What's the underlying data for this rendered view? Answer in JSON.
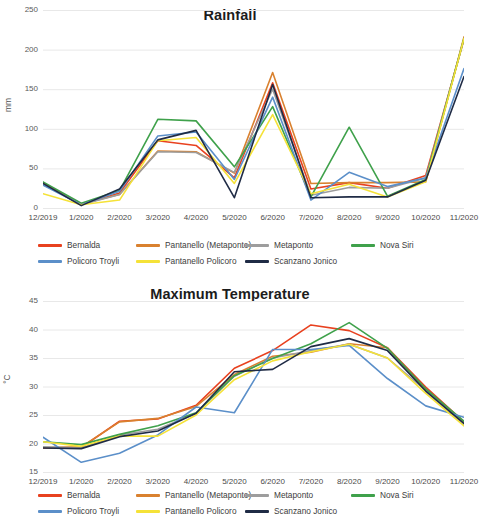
{
  "chart_data": [
    {
      "type": "line",
      "title": "Rainfall",
      "xlabel": "",
      "ylabel": "mm",
      "ylim": [
        0,
        250
      ],
      "yticks": [
        0,
        50,
        100,
        150,
        200,
        250
      ],
      "grid": true,
      "legend_position": "bottom",
      "categories": [
        "12/2019",
        "1/2020",
        "2/2020",
        "3/2020",
        "4/2020",
        "5/2020",
        "6/2020",
        "7/2020",
        "8/2020",
        "9/2020",
        "10/2020",
        "11/2020"
      ],
      "series": [
        {
          "name": "Bernalda",
          "color": "#e8411f",
          "values": [
            32,
            4,
            19,
            85,
            79,
            38,
            158,
            24,
            32,
            25,
            41,
            213
          ]
        },
        {
          "name": "Pantanello (Metaponto)",
          "color": "#d9812f",
          "values": [
            31,
            5,
            17,
            72,
            71,
            44,
            171,
            31,
            32,
            32,
            33,
            216
          ]
        },
        {
          "name": "Metaponto",
          "color": "#9d9d9d",
          "values": [
            30,
            4,
            17,
            71,
            70,
            45,
            150,
            16,
            26,
            25,
            38,
            214
          ]
        },
        {
          "name": "Nova Siri",
          "color": "#3fa14b",
          "values": [
            33,
            6,
            22,
            112,
            110,
            52,
            128,
            14,
            102,
            15,
            36,
            214
          ]
        },
        {
          "name": "Policoro Troyli",
          "color": "#5b8fc9",
          "values": [
            29,
            4,
            21,
            91,
            96,
            36,
            140,
            10,
            45,
            27,
            38,
            176
          ]
        },
        {
          "name": "Pantanello Policoro",
          "color": "#f5e238",
          "values": [
            18,
            4,
            10,
            85,
            89,
            31,
            118,
            18,
            30,
            14,
            33,
            214
          ]
        },
        {
          "name": "Scanzano Jonico",
          "color": "#1f2b45",
          "values": [
            31,
            3,
            24,
            86,
            98,
            13,
            156,
            13,
            14,
            14,
            35,
            166
          ]
        }
      ]
    },
    {
      "type": "line",
      "title": "Maximum Temperature",
      "xlabel": "",
      "ylabel": "°C",
      "ylim": [
        15,
        45
      ],
      "yticks": [
        15,
        20,
        25,
        30,
        35,
        40,
        45
      ],
      "grid": true,
      "legend_position": "bottom",
      "categories": [
        "12/2019",
        "1/2020",
        "2/2020",
        "3/2020",
        "4/2020",
        "5/2020",
        "6/2020",
        "7/2020",
        "8/2020",
        "9/2020",
        "10/2020",
        "11/2020"
      ],
      "series": [
        {
          "name": "Bernalda",
          "color": "#e8411f",
          "values": [
            19.2,
            19.3,
            23.9,
            24.3,
            26.7,
            33.2,
            36.3,
            40.8,
            39.8,
            36.8,
            29.9,
            23.8
          ]
        },
        {
          "name": "Pantanello (Metaponto)",
          "color": "#d9812f",
          "values": [
            19.3,
            19.4,
            23.8,
            24.4,
            26.5,
            32.1,
            35.3,
            36.0,
            37.5,
            36.8,
            29.4,
            23.7
          ]
        },
        {
          "name": "Metaponto",
          "color": "#9d9d9d",
          "values": [
            19.4,
            19.2,
            21.5,
            22.5,
            25.3,
            31.8,
            35.0,
            36.3,
            37.4,
            35.0,
            29.3,
            23.9
          ]
        },
        {
          "name": "Nova Siri",
          "color": "#3fa14b",
          "values": [
            20.3,
            19.8,
            21.6,
            23.1,
            25.4,
            31.9,
            34.9,
            37.5,
            41.2,
            36.7,
            29.6,
            23.9
          ]
        },
        {
          "name": "Policoro Troyli",
          "color": "#5b8fc9",
          "values": [
            21.1,
            16.7,
            18.3,
            21.5,
            26.4,
            25.4,
            36.5,
            36.5,
            37.2,
            31.4,
            26.6,
            24.6
          ]
        },
        {
          "name": "Pantanello Policoro",
          "color": "#f5e238",
          "values": [
            20.3,
            19.5,
            21.3,
            21.3,
            25.0,
            31.2,
            34.5,
            36.1,
            37.4,
            35.0,
            28.8,
            23.1
          ]
        },
        {
          "name": "Scanzano Jonico",
          "color": "#1f2b45",
          "values": [
            19.2,
            19.1,
            21.2,
            22.2,
            25.3,
            32.6,
            33.0,
            37.0,
            38.4,
            36.3,
            29.2,
            23.5
          ]
        }
      ]
    }
  ],
  "rainfall": {
    "title": "Rainfall",
    "ylabel": "mm",
    "yticks": [
      "250",
      "200",
      "150",
      "100",
      "50",
      "0"
    ],
    "xticks": [
      "12/2019",
      "1/2020",
      "2/2020",
      "3/2020",
      "4/2020",
      "5/2020",
      "6/2020",
      "7/2020",
      "8/2020",
      "9/2020",
      "10/2020",
      "11/2020"
    ],
    "legend": [
      {
        "label": "Bernalda",
        "color": "#e8411f"
      },
      {
        "label": "Pantanello (Metaponto)",
        "color": "#d9812f"
      },
      {
        "label": "Metaponto",
        "color": "#9d9d9d"
      },
      {
        "label": "Nova Siri",
        "color": "#3fa14b"
      },
      {
        "label": "Policoro Troyli",
        "color": "#5b8fc9"
      },
      {
        "label": "Pantanello Policoro",
        "color": "#f5e238"
      },
      {
        "label": "Scanzano Jonico",
        "color": "#1f2b45"
      }
    ]
  },
  "temperature": {
    "title": "Maximum Temperature",
    "ylabel": "°C",
    "yticks": [
      "45",
      "40",
      "35",
      "30",
      "25",
      "20",
      "15"
    ],
    "xticks": [
      "12/2019",
      "1/2020",
      "2/2020",
      "3/2020",
      "4/2020",
      "5/2020",
      "6/2020",
      "7/2020",
      "8/2020",
      "9/2020",
      "10/2020",
      "11/2020"
    ],
    "legend": [
      {
        "label": "Bernalda",
        "color": "#e8411f"
      },
      {
        "label": "Pantanello (Metaponto)",
        "color": "#d9812f"
      },
      {
        "label": "Metaponto",
        "color": "#9d9d9d"
      },
      {
        "label": "Nova Siri",
        "color": "#3fa14b"
      },
      {
        "label": "Policoro Troyli",
        "color": "#5b8fc9"
      },
      {
        "label": "Pantanello Policoro",
        "color": "#f5e238"
      },
      {
        "label": "Scanzano Jonico",
        "color": "#1f2b45"
      }
    ]
  }
}
